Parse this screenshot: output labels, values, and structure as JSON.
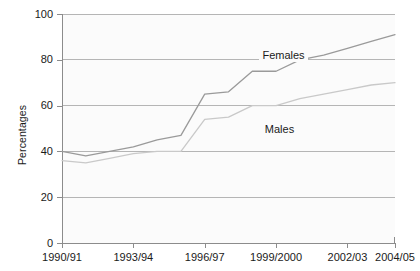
{
  "chart_data": {
    "type": "line",
    "title": "",
    "xlabel": "",
    "ylabel": "Percentages",
    "ylim": [
      0,
      100
    ],
    "yticks": [
      0,
      20,
      40,
      60,
      80,
      100
    ],
    "grid": true,
    "legend_position": "inline-annotations",
    "x": [
      "1990/91",
      "1991/92",
      "1992/93",
      "1993/94",
      "1994/95",
      "1995/96",
      "1996/97",
      "1997/98",
      "1998/99",
      "1999/2000",
      "2000/01",
      "2001/02",
      "2002/03",
      "2003/04",
      "2004/05"
    ],
    "xtick_labels": [
      "1990/91",
      "1993/94",
      "1996/97",
      "1999/2000",
      "2002/03",
      "2004/05"
    ],
    "xtick_indices": [
      0,
      3,
      6,
      9,
      12,
      14
    ],
    "series": [
      {
        "name": "Females",
        "color": "#9a9a9a",
        "values": [
          40,
          38,
          40,
          42,
          45,
          47,
          65,
          66,
          75,
          75,
          80,
          82,
          85,
          88,
          91
        ]
      },
      {
        "name": "Males",
        "color": "#c9c9c9",
        "values": [
          36,
          35,
          37,
          39,
          40,
          40,
          54,
          55,
          60,
          60,
          63,
          65,
          67,
          69,
          70
        ]
      }
    ],
    "annotations": [
      {
        "text": "Females",
        "x_index": 8.3,
        "value": 82
      },
      {
        "text": "Males",
        "x_index": 8.4,
        "value": 50
      }
    ],
    "axis_color": "#8c8c8c",
    "grid_color": "#b5b5b5"
  }
}
